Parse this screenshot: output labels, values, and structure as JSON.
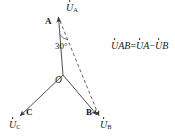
{
  "figure": {
    "type": "phasor-diagram",
    "background_color": "#ffffff",
    "line_color": "#3a3a3a"
  },
  "nodes": [
    {
      "id": "A",
      "label": "A"
    },
    {
      "id": "B",
      "label": "B"
    },
    {
      "id": "C",
      "label": "C"
    },
    {
      "id": "O",
      "label": "O"
    }
  ],
  "phasors": [
    {
      "id": "UA",
      "symbol": "U",
      "subscript": "A"
    },
    {
      "id": "UB",
      "symbol": "U",
      "subscript": "B"
    },
    {
      "id": "UC",
      "symbol": "U",
      "subscript": "C"
    }
  ],
  "angle": {
    "value": "30",
    "unit": "°",
    "label": "30°"
  },
  "equation": {
    "lhs_symbol": "U",
    "lhs_sub": "AB",
    "eq": "=",
    "term1_symbol": "U",
    "term1_sub": "A",
    "minus": "−",
    "term2_symbol": "U",
    "term2_sub": "B"
  }
}
